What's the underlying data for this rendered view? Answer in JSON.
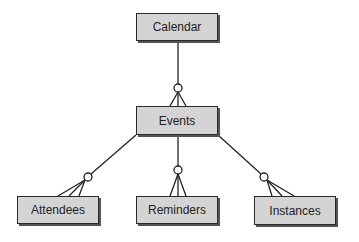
{
  "diagram": {
    "type": "entity-relationship",
    "notation": "crows-foot (zero-or-many)",
    "entities": [
      {
        "id": "calendar",
        "label": "Calendar"
      },
      {
        "id": "events",
        "label": "Events"
      },
      {
        "id": "attendees",
        "label": "Attendees"
      },
      {
        "id": "reminders",
        "label": "Reminders"
      },
      {
        "id": "instances",
        "label": "Instances"
      }
    ],
    "relationships": [
      {
        "from": "calendar",
        "to": "events",
        "cardinality": "zero-or-many"
      },
      {
        "from": "events",
        "to": "attendees",
        "cardinality": "zero-or-many"
      },
      {
        "from": "events",
        "to": "reminders",
        "cardinality": "zero-or-many"
      },
      {
        "from": "events",
        "to": "instances",
        "cardinality": "zero-or-many"
      }
    ],
    "colors": {
      "box_fill": "#d4d4d4",
      "border": "#2a2a2a",
      "line": "#222222",
      "background": "#ffffff"
    }
  }
}
